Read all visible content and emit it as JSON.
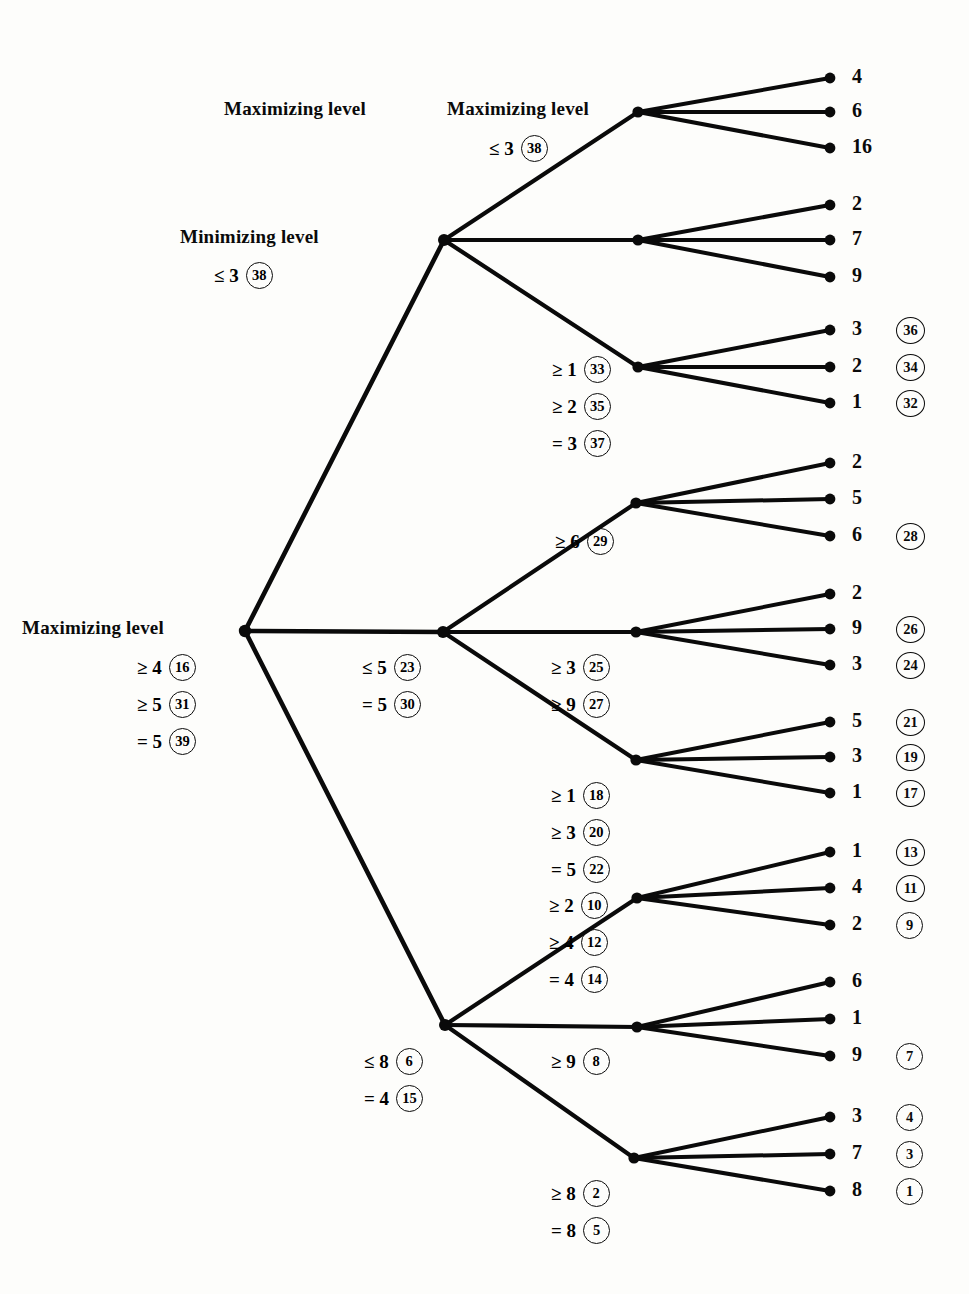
{
  "diagram": {
    "level_labels": [
      {
        "text": "Maximizing level",
        "x": 224,
        "y": 98
      },
      {
        "text": "Minimizing level",
        "x": 180,
        "y": 226
      },
      {
        "text": "Maximizing level",
        "x": 22,
        "y": 617
      },
      {
        "text": "Maximizing level",
        "x": 447,
        "y": 98
      }
    ],
    "colors": {
      "ink": "#0a0a0a",
      "paper": "#fdfdfb"
    },
    "geometry": {
      "root": {
        "x": 245,
        "y": 631
      },
      "mid_nodes": [
        {
          "x": 444,
          "y": 240
        },
        {
          "x": 443,
          "y": 632
        },
        {
          "x": 445,
          "y": 1025
        }
      ],
      "inner_nodes": [
        {
          "x": 638,
          "y": 112
        },
        {
          "x": 638,
          "y": 240
        },
        {
          "x": 638,
          "y": 367
        },
        {
          "x": 636,
          "y": 503
        },
        {
          "x": 636,
          "y": 632
        },
        {
          "x": 636,
          "y": 760
        },
        {
          "x": 637,
          "y": 898
        },
        {
          "x": 637,
          "y": 1027
        },
        {
          "x": 634,
          "y": 1158
        }
      ],
      "leaf_x": 830,
      "leaf_text_x": 852,
      "circle_x": 896
    },
    "leaf_groups": [
      {
        "parent": 0,
        "leaves": [
          {
            "value": "4",
            "y": 78,
            "circle": null
          },
          {
            "value": "6",
            "y": 112,
            "circle": null
          },
          {
            "value": "16",
            "y": 148,
            "circle": null
          }
        ]
      },
      {
        "parent": 1,
        "leaves": [
          {
            "value": "2",
            "y": 205,
            "circle": null
          },
          {
            "value": "7",
            "y": 240,
            "circle": null
          },
          {
            "value": "9",
            "y": 277,
            "circle": null
          }
        ]
      },
      {
        "parent": 2,
        "leaves": [
          {
            "value": "3",
            "y": 330,
            "circle": "36"
          },
          {
            "value": "2",
            "y": 367,
            "circle": "34"
          },
          {
            "value": "1",
            "y": 403,
            "circle": "32"
          }
        ]
      },
      {
        "parent": 3,
        "leaves": [
          {
            "value": "2",
            "y": 463,
            "circle": null
          },
          {
            "value": "5",
            "y": 499,
            "circle": null
          },
          {
            "value": "6",
            "y": 536,
            "circle": "28"
          }
        ]
      },
      {
        "parent": 4,
        "leaves": [
          {
            "value": "2",
            "y": 594,
            "circle": null
          },
          {
            "value": "9",
            "y": 629,
            "circle": "26"
          },
          {
            "value": "3",
            "y": 665,
            "circle": "24"
          }
        ]
      },
      {
        "parent": 5,
        "leaves": [
          {
            "value": "5",
            "y": 722,
            "circle": "21"
          },
          {
            "value": "3",
            "y": 757,
            "circle": "19"
          },
          {
            "value": "1",
            "y": 793,
            "circle": "17"
          }
        ]
      },
      {
        "parent": 6,
        "leaves": [
          {
            "value": "1",
            "y": 852,
            "circle": "13"
          },
          {
            "value": "4",
            "y": 888,
            "circle": "11"
          },
          {
            "value": "2",
            "y": 925,
            "circle": "9"
          }
        ]
      },
      {
        "parent": 7,
        "leaves": [
          {
            "value": "6",
            "y": 982,
            "circle": null
          },
          {
            "value": "1",
            "y": 1019,
            "circle": null
          },
          {
            "value": "9",
            "y": 1056,
            "circle": "7"
          }
        ]
      },
      {
        "parent": 8,
        "leaves": [
          {
            "value": "3",
            "y": 1117,
            "circle": "4"
          },
          {
            "value": "7",
            "y": 1154,
            "circle": "3"
          },
          {
            "value": "8",
            "y": 1191,
            "circle": "1"
          }
        ]
      }
    ],
    "bound_labels": [
      {
        "id": "b-max-top",
        "x": 489,
        "y": 135,
        "rows": [
          {
            "op": "≤ 3",
            "circle": "38"
          }
        ]
      },
      {
        "id": "b-min-top",
        "x": 214,
        "y": 262,
        "rows": [
          {
            "op": "≤ 3",
            "circle": "38"
          }
        ]
      },
      {
        "id": "b-inner-33",
        "x": 552,
        "y": 356,
        "rows": [
          {
            "op": "≥ 1",
            "circle": "33"
          },
          {
            "op": "≥ 2",
            "circle": "35"
          },
          {
            "op": "= 3",
            "circle": "37"
          }
        ]
      },
      {
        "id": "b-inner-29",
        "x": 555,
        "y": 528,
        "rows": [
          {
            "op": "≥ 6",
            "circle": "29"
          }
        ]
      },
      {
        "id": "b-mid-23",
        "x": 362,
        "y": 654,
        "rows": [
          {
            "op": "≤ 5",
            "circle": "23"
          },
          {
            "op": "= 5",
            "circle": "30"
          }
        ]
      },
      {
        "id": "b-inner-25",
        "x": 551,
        "y": 654,
        "rows": [
          {
            "op": "≥ 3",
            "circle": "25"
          },
          {
            "op": "≥ 9",
            "circle": "27"
          }
        ]
      },
      {
        "id": "b-inner-18",
        "x": 551,
        "y": 782,
        "rows": [
          {
            "op": "≥ 1",
            "circle": "18"
          },
          {
            "op": "≥ 3",
            "circle": "20"
          },
          {
            "op": "= 5",
            "circle": "22"
          }
        ]
      },
      {
        "id": "b-root",
        "x": 137,
        "y": 654,
        "rows": [
          {
            "op": "≥ 4",
            "circle": "16"
          },
          {
            "op": "≥ 5",
            "circle": "31"
          },
          {
            "op": "= 5",
            "circle": "39"
          }
        ]
      },
      {
        "id": "b-inner-10",
        "x": 549,
        "y": 892,
        "rows": [
          {
            "op": "≥ 2",
            "circle": "10"
          },
          {
            "op": "≥ 4",
            "circle": "12"
          },
          {
            "op": "= 4",
            "circle": "14"
          }
        ]
      },
      {
        "id": "b-mid-6",
        "x": 364,
        "y": 1048,
        "rows": [
          {
            "op": "≤ 8",
            "circle": "6"
          },
          {
            "op": "= 4",
            "circle": "15"
          }
        ]
      },
      {
        "id": "b-inner-8",
        "x": 551,
        "y": 1048,
        "rows": [
          {
            "op": "≥ 9",
            "circle": "8"
          }
        ]
      },
      {
        "id": "b-inner-2",
        "x": 551,
        "y": 1180,
        "rows": [
          {
            "op": "≥ 8",
            "circle": "2"
          },
          {
            "op": "= 8",
            "circle": "5"
          }
        ]
      }
    ]
  }
}
